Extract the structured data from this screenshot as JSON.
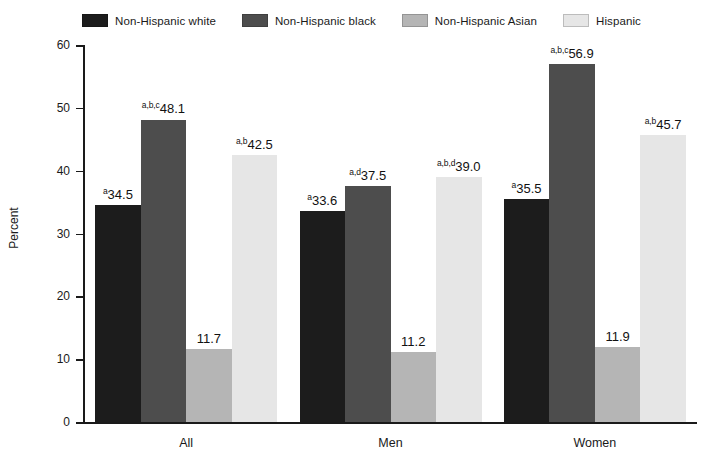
{
  "chart_data": {
    "type": "bar",
    "title": "",
    "xlabel": "",
    "ylabel": "Percent",
    "ylim": [
      0,
      60
    ],
    "yticks": [
      0,
      10,
      20,
      30,
      40,
      50,
      60
    ],
    "grid": false,
    "legend_position": "top",
    "categories": [
      "All",
      "Men",
      "Women"
    ],
    "series": [
      {
        "name": "Non-Hispanic white",
        "color": "#1c1c1c",
        "values": [
          34.5,
          33.6,
          35.5
        ],
        "labels": [
          "34.5",
          "33.6",
          "35.5"
        ],
        "superscripts": [
          "a",
          "a",
          "a"
        ]
      },
      {
        "name": "Non-Hispanic black",
        "color": "#4d4d4d",
        "values": [
          48.1,
          37.5,
          56.9
        ],
        "labels": [
          "48.1",
          "37.5",
          "56.9"
        ],
        "superscripts": [
          "a,b,c",
          "a,d",
          "a,b,c"
        ]
      },
      {
        "name": "Non-Hispanic Asian",
        "color": "#b5b5b5",
        "values": [
          11.7,
          11.2,
          11.9
        ],
        "labels": [
          "11.7",
          "11.2",
          "11.9"
        ],
        "superscripts": [
          "",
          "",
          ""
        ]
      },
      {
        "name": "Hispanic",
        "color": "#e6e6e6",
        "values": [
          42.5,
          39.0,
          45.7
        ],
        "labels": [
          "42.5",
          "39.0",
          "45.7"
        ],
        "superscripts": [
          "a,b",
          "a,b,d",
          "a,b"
        ]
      }
    ]
  },
  "axis": {
    "y_title": "Percent",
    "tick_labels": [
      "0",
      "10",
      "20",
      "30",
      "40",
      "50",
      "60"
    ]
  },
  "legend": {
    "items": [
      {
        "label": "Non-Hispanic white",
        "color": "#1c1c1c"
      },
      {
        "label": "Non-Hispanic black",
        "color": "#4d4d4d"
      },
      {
        "label": "Non-Hispanic Asian",
        "color": "#b5b5b5"
      },
      {
        "label": "Hispanic",
        "color": "#e6e6e6"
      }
    ]
  }
}
